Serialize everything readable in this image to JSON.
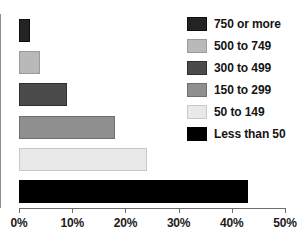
{
  "chart_data": {
    "type": "bar",
    "orientation": "horizontal",
    "title": "",
    "xlabel": "",
    "ylabel": "",
    "xlim": [
      0,
      50
    ],
    "grid": false,
    "legend_position": "top-right",
    "categories": [
      "750 or more",
      "500 to 749",
      "300 to 499",
      "150 to 299",
      "50 to 149",
      "Less than 50"
    ],
    "values": [
      2,
      4,
      9,
      18,
      24,
      43
    ],
    "value_suffix": "%",
    "tick_labels": [
      "0%",
      "10%",
      "20%",
      "30%",
      "40%",
      "50%"
    ],
    "tick_values": [
      0,
      10,
      20,
      30,
      40,
      50
    ],
    "colors": [
      "#232323",
      "#b9b9b9",
      "#4b4b4b",
      "#8f8f8f",
      "#e9e9e9",
      "#000000"
    ],
    "border_colors": [
      "#0f0f0f",
      "#9a9a9a",
      "#2f2f2f",
      "#6f6f6f",
      "#c9c9c9",
      "#000000"
    ],
    "bars": [
      {
        "label": "750 or more",
        "value": 2,
        "color": "#232323",
        "border": "#0f0f0f"
      },
      {
        "label": "500 to 749",
        "value": 4,
        "color": "#b9b9b9",
        "border": "#9a9a9a"
      },
      {
        "label": "300 to 499",
        "value": 9,
        "color": "#4b4b4b",
        "border": "#2f2f2f"
      },
      {
        "label": "150 to 299",
        "value": 18,
        "color": "#8f8f8f",
        "border": "#6f6f6f"
      },
      {
        "label": "50 to 149",
        "value": 24,
        "color": "#e9e9e9",
        "border": "#c9c9c9"
      },
      {
        "label": "Less than 50",
        "value": 43,
        "color": "#000000",
        "border": "#000000"
      }
    ],
    "legend": [
      {
        "label": "750 or more",
        "color": "#232323",
        "border": "#0f0f0f"
      },
      {
        "label": "500 to 749",
        "color": "#b9b9b9",
        "border": "#9a9a9a"
      },
      {
        "label": "300 to 499",
        "color": "#4b4b4b",
        "border": "#2f2f2f"
      },
      {
        "label": "150 to 299",
        "color": "#8f8f8f",
        "border": "#6f6f6f"
      },
      {
        "label": "50 to 149",
        "color": "#e9e9e9",
        "border": "#c9c9c9"
      },
      {
        "label": "Less than 50",
        "color": "#000000",
        "border": "#000000"
      }
    ]
  }
}
